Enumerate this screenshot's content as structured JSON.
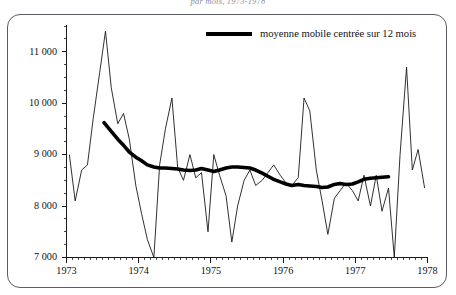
{
  "caption": "par mois, 1973-1978",
  "legend": {
    "position": "top-right",
    "entries": [
      {
        "label": "moyenne mobile centrée sur 12 mois",
        "style": "thick-line",
        "color": "#000000"
      }
    ]
  },
  "frame": {
    "border_color": "#5b5b63",
    "background": "#ffffff",
    "corner_radius": "13px"
  },
  "chart_data": {
    "type": "line",
    "title": "par mois, 1973-1978",
    "xlabel": "",
    "ylabel": "",
    "grid": false,
    "xlim": [
      1973.0,
      1978.0
    ],
    "ylim": [
      7000,
      11500
    ],
    "yticks": [
      7000,
      8000,
      9000,
      10000,
      11000
    ],
    "ytick_labels": [
      "7 000",
      "8 000",
      "9 000",
      "10 000",
      "11 000"
    ],
    "ytick_minor_step": 250,
    "xticks": [
      1973,
      1974,
      1975,
      1976,
      1977,
      1978
    ],
    "xtick_labels": [
      "1973",
      "1974",
      "1975",
      "1976",
      "1977",
      "1978"
    ],
    "xtick_minor_step": 0.0833,
    "axis_color": "#1a1a1a",
    "series": [
      {
        "name": "série brute (mensuelle)",
        "style": "thin-line",
        "color": "#1a1a1a",
        "width": 0.9,
        "x": [
          1973.04,
          1973.12,
          1973.21,
          1973.29,
          1973.37,
          1973.46,
          1973.54,
          1973.62,
          1973.71,
          1973.79,
          1973.87,
          1973.96,
          1974.04,
          1974.12,
          1974.21,
          1974.29,
          1974.37,
          1974.46,
          1974.54,
          1974.62,
          1974.71,
          1974.79,
          1974.87,
          1974.96,
          1975.04,
          1975.12,
          1975.21,
          1975.29,
          1975.37,
          1975.46,
          1975.54,
          1975.62,
          1975.71,
          1975.79,
          1975.87,
          1975.96,
          1976.04,
          1976.12,
          1976.21,
          1976.29,
          1976.37,
          1976.46,
          1976.54,
          1976.62,
          1976.71,
          1976.79,
          1976.87,
          1976.96,
          1977.04,
          1977.12,
          1977.21,
          1977.29,
          1977.37,
          1977.46,
          1977.54,
          1977.62,
          1977.71,
          1977.79,
          1977.87,
          1977.96
        ],
        "values": [
          9000,
          8100,
          8700,
          8800,
          9700,
          10600,
          11400,
          10300,
          9600,
          9800,
          9300,
          8400,
          7850,
          7350,
          7000,
          8800,
          9500,
          10100,
          8750,
          8500,
          9000,
          8550,
          8650,
          7500,
          9000,
          8600,
          8200,
          7300,
          8000,
          8500,
          8700,
          8400,
          8500,
          8650,
          8800,
          8600,
          8450,
          8400,
          8550,
          10100,
          9850,
          8700,
          8100,
          7450,
          8150,
          8300,
          8450,
          8300,
          8100,
          8600,
          8000,
          8600,
          7900,
          8350,
          7000,
          9000,
          10700,
          8700,
          9100,
          8350
        ]
      },
      {
        "name": "moyenne mobile centrée sur 12 mois",
        "style": "thick-line",
        "color": "#000000",
        "width": 3.6,
        "x": [
          1973.52,
          1973.62,
          1973.71,
          1973.79,
          1973.87,
          1973.96,
          1974.04,
          1974.12,
          1974.21,
          1974.29,
          1974.37,
          1974.46,
          1974.54,
          1974.62,
          1974.71,
          1974.79,
          1974.87,
          1974.96,
          1975.04,
          1975.12,
          1975.21,
          1975.29,
          1975.37,
          1975.46,
          1975.54,
          1975.62,
          1975.71,
          1975.79,
          1975.87,
          1975.96,
          1976.04,
          1976.12,
          1976.21,
          1976.29,
          1976.37,
          1976.46,
          1976.54,
          1976.62,
          1976.71,
          1976.79,
          1976.87,
          1976.96,
          1977.04,
          1977.12,
          1977.21,
          1977.29,
          1977.37,
          1977.46
        ],
        "values": [
          9620,
          9450,
          9300,
          9180,
          9050,
          8950,
          8880,
          8800,
          8760,
          8740,
          8740,
          8730,
          8720,
          8700,
          8690,
          8700,
          8730,
          8700,
          8670,
          8700,
          8740,
          8760,
          8760,
          8750,
          8740,
          8700,
          8640,
          8580,
          8520,
          8470,
          8430,
          8400,
          8420,
          8400,
          8390,
          8380,
          8360,
          8370,
          8420,
          8440,
          8420,
          8430,
          8470,
          8520,
          8540,
          8550,
          8560,
          8570
        ]
      }
    ]
  }
}
